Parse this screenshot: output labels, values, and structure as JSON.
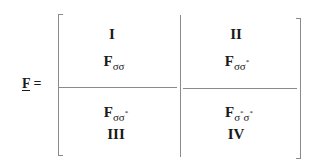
{
  "equation": {
    "lhs_symbol": "F",
    "equals": "="
  },
  "matrix": {
    "blocks": [
      {
        "id": "I",
        "roman": "I",
        "symbol": "F",
        "subscript": "σσ",
        "sub_parts": [
          {
            "s": "σ",
            "star": ""
          },
          {
            "s": "σ",
            "star": ""
          }
        ]
      },
      {
        "id": "II",
        "roman": "II",
        "symbol": "F",
        "subscript": "σσ*",
        "sub_parts": [
          {
            "s": "σ",
            "star": ""
          },
          {
            "s": "σ",
            "star": "*"
          }
        ]
      },
      {
        "id": "III",
        "roman": "III",
        "symbol": "F",
        "subscript": "σσ*",
        "sub_parts": [
          {
            "s": "σ",
            "star": ""
          },
          {
            "s": "σ",
            "star": "*"
          }
        ]
      },
      {
        "id": "IV",
        "roman": "IV",
        "symbol": "F",
        "subscript": "σ*σ*",
        "sub_parts": [
          {
            "s": "σ",
            "star": "*"
          },
          {
            "s": "σ",
            "star": "*"
          }
        ]
      }
    ]
  },
  "colors": {
    "line": "#8a8a8a",
    "text": "#1a1a1a",
    "background": "#ffffff"
  }
}
